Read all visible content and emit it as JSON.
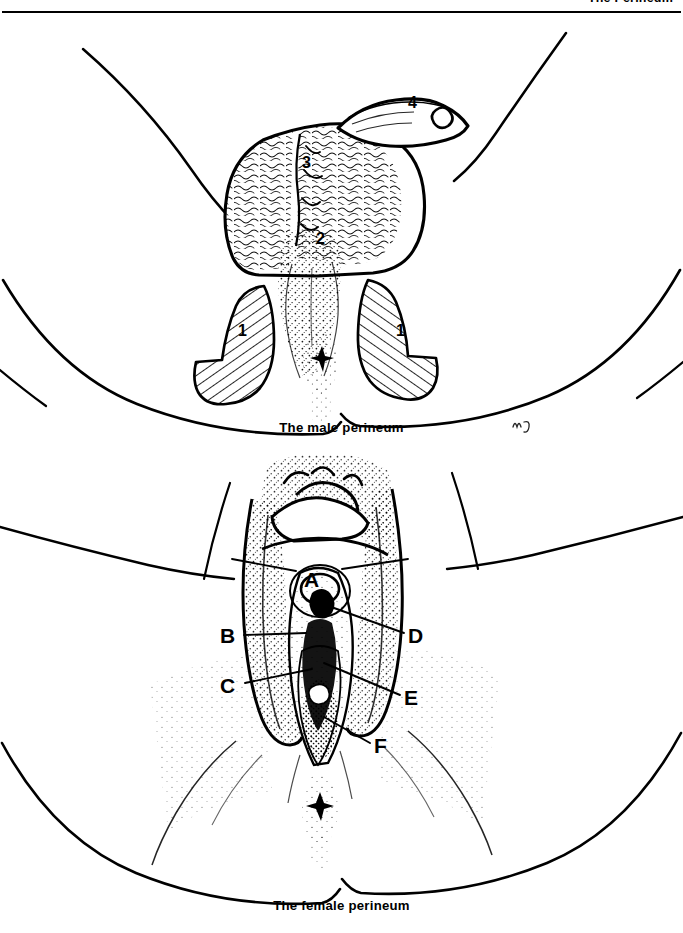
{
  "header": {
    "title": "The Perineum"
  },
  "figures": [
    {
      "id": "male",
      "caption": "The male perineum",
      "illustration": "line-drawing of the male perineum viewed from below, showing the scrotum and penis between two flexed thighs, with the anus at the lower midline",
      "signature": "artist monogram",
      "labels": [
        {
          "key": "1",
          "x": 238,
          "y": 318
        },
        {
          "key": "1",
          "x": 396,
          "y": 318
        },
        {
          "key": "2",
          "x": 318,
          "y": 244
        },
        {
          "key": "3",
          "x": 304,
          "y": 168
        },
        {
          "key": "4",
          "x": 410,
          "y": 108
        }
      ]
    },
    {
      "id": "female",
      "caption": "The female perineum",
      "illustration": "line-drawing of the female perineum viewed from below, showing the vulva between two flexed thighs, with the anus at the lower midline",
      "labels": [
        {
          "key": "A",
          "x": 305,
          "y": 586
        },
        {
          "key": "B",
          "x": 222,
          "y": 648
        },
        {
          "key": "C",
          "x": 222,
          "y": 695
        },
        {
          "key": "D",
          "x": 410,
          "y": 648
        },
        {
          "key": "E",
          "x": 407,
          "y": 708
        },
        {
          "key": "F",
          "x": 375,
          "y": 757
        }
      ],
      "leaders": [
        {
          "key": "A",
          "from": [
            298,
            578
          ],
          "to": [
            232,
            566
          ]
        },
        {
          "key": "A",
          "from": [
            330,
            578
          ],
          "to": [
            406,
            566
          ]
        },
        {
          "key": "B",
          "from": [
            242,
            641
          ],
          "to": [
            300,
            641
          ]
        },
        {
          "key": "C",
          "from": [
            243,
            688
          ],
          "to": [
            310,
            676
          ]
        },
        {
          "key": "D",
          "from": [
            404,
            640
          ],
          "to": [
            318,
            625
          ]
        },
        {
          "key": "E",
          "from": [
            402,
            701
          ],
          "to": [
            322,
            672
          ]
        },
        {
          "key": "F",
          "from": [
            371,
            749
          ],
          "to": [
            322,
            726
          ]
        }
      ]
    }
  ],
  "colors": {
    "ink": "#000000",
    "paper": "#ffffff",
    "stipple": "#1a1a1a"
  }
}
